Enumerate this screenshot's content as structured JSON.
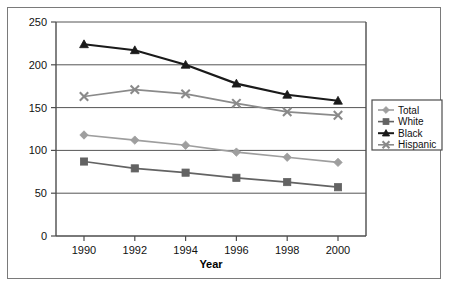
{
  "chart_data": {
    "type": "line",
    "title": "",
    "xlabel": "Year",
    "ylabel": "",
    "categories": [
      "1990",
      "1992",
      "1994",
      "1996",
      "1998",
      "2000"
    ],
    "x": [
      1990,
      1992,
      1994,
      1996,
      1998,
      2000
    ],
    "xlim": [
      1989,
      2001
    ],
    "ylim": [
      0,
      250
    ],
    "yticks": [
      "0",
      "50",
      "100",
      "150",
      "200",
      "250"
    ],
    "ytick_values": [
      0,
      50,
      100,
      150,
      200,
      250
    ],
    "grid": "horizontal",
    "legend_position": "right",
    "series": [
      {
        "name": "Total",
        "marker": "diamond",
        "color": "#9e9e9e",
        "values": [
          118,
          112,
          106,
          98,
          92,
          86
        ]
      },
      {
        "name": "White",
        "marker": "square",
        "color": "#636363",
        "values": [
          87,
          79,
          74,
          68,
          63,
          57
        ]
      },
      {
        "name": "Black",
        "marker": "triangle",
        "color": "#1a1a1a",
        "values": [
          224,
          217,
          200,
          178,
          165,
          158
        ]
      },
      {
        "name": "Hispanic",
        "marker": "x",
        "color": "#8a8a8a",
        "values": [
          163,
          171,
          166,
          155,
          145,
          141
        ]
      }
    ]
  },
  "axes": {
    "y_ticks": [
      {
        "label": "250"
      },
      {
        "label": "200"
      },
      {
        "label": "150"
      },
      {
        "label": "100"
      },
      {
        "label": "50"
      },
      {
        "label": "0"
      }
    ],
    "x_ticks": [
      {
        "label": "1990"
      },
      {
        "label": "1992"
      },
      {
        "label": "1994"
      },
      {
        "label": "1996"
      },
      {
        "label": "1998"
      },
      {
        "label": "2000"
      }
    ],
    "x_axis_title": "Year"
  },
  "legend": {
    "items": [
      {
        "label": "Total",
        "marker": "diamond",
        "color": "#9e9e9e"
      },
      {
        "label": "White",
        "marker": "square",
        "color": "#636363"
      },
      {
        "label": "Black",
        "marker": "triangle",
        "color": "#1a1a1a"
      },
      {
        "label": "Hispanic",
        "marker": "x",
        "color": "#8a8a8a"
      }
    ]
  },
  "colors": {
    "plot_border": "#4d4d4d",
    "grid_line": "#555555",
    "outer_frame": "#7a7a7a",
    "background": "#ffffff"
  }
}
